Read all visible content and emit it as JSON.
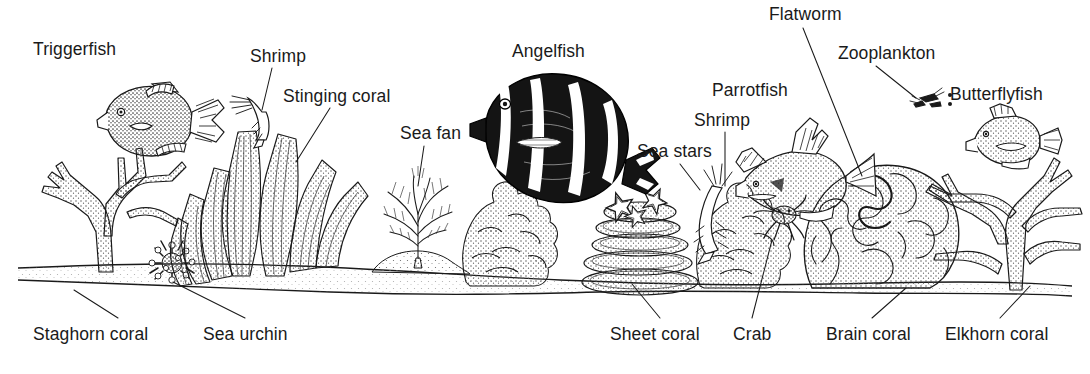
{
  "diagram": {
    "type": "labeled-illustration",
    "style": "black-and-white line drawing with stipple shading",
    "colors": {
      "background": "#ffffff",
      "ink": "#1a1a1a",
      "stipple": "#555555",
      "angelfish_body": "#111111"
    },
    "labels": [
      {
        "id": "triggerfish",
        "text": "Triggerfish",
        "x": 33,
        "y": 40,
        "align": "left",
        "leader": false
      },
      {
        "id": "shrimp-left",
        "text": "Shrimp",
        "x": 250,
        "y": 47,
        "align": "left",
        "leader": true
      },
      {
        "id": "stinging-coral",
        "text": "Stinging coral",
        "x": 283,
        "y": 87,
        "align": "left",
        "leader": true
      },
      {
        "id": "sea-fan",
        "text": "Sea fan",
        "x": 400,
        "y": 124,
        "align": "left",
        "leader": true
      },
      {
        "id": "angelfish",
        "text": "Angelfish",
        "x": 512,
        "y": 42,
        "align": "left",
        "leader": false
      },
      {
        "id": "sea-stars",
        "text": "Sea stars",
        "x": 637,
        "y": 142,
        "align": "left",
        "leader": true
      },
      {
        "id": "shrimp-right",
        "text": "Shrimp",
        "x": 694,
        "y": 111,
        "align": "left",
        "leader": true
      },
      {
        "id": "parrotfish",
        "text": "Parrotfish",
        "x": 712,
        "y": 81,
        "align": "left",
        "leader": false
      },
      {
        "id": "flatworm",
        "text": "Flatworm",
        "x": 769,
        "y": 5,
        "align": "left",
        "leader": true
      },
      {
        "id": "zooplankton",
        "text": "Zooplankton",
        "x": 838,
        "y": 44,
        "align": "left",
        "leader": true
      },
      {
        "id": "butterflyfish",
        "text": "Butterflyfish",
        "x": 950,
        "y": 85,
        "align": "left",
        "leader": false
      },
      {
        "id": "staghorn-coral",
        "text": "Staghorn coral",
        "x": 33,
        "y": 325,
        "align": "left",
        "leader": true
      },
      {
        "id": "sea-urchin",
        "text": "Sea urchin",
        "x": 203,
        "y": 325,
        "align": "left",
        "leader": true
      },
      {
        "id": "sheet-coral",
        "text": "Sheet coral",
        "x": 610,
        "y": 325,
        "align": "left",
        "leader": true
      },
      {
        "id": "crab",
        "text": "Crab",
        "x": 733,
        "y": 325,
        "align": "left",
        "leader": true
      },
      {
        "id": "brain-coral",
        "text": "Brain coral",
        "x": 826,
        "y": 325,
        "align": "left",
        "leader": true
      },
      {
        "id": "elkhorn-coral",
        "text": "Elkhorn coral",
        "x": 945,
        "y": 325,
        "align": "left",
        "leader": true
      }
    ],
    "organisms": [
      "Triggerfish",
      "Shrimp",
      "Stinging coral",
      "Sea fan",
      "Angelfish",
      "Sea stars",
      "Parrotfish",
      "Flatworm",
      "Zooplankton",
      "Butterflyfish",
      "Staghorn coral",
      "Sea urchin",
      "Sheet coral",
      "Crab",
      "Brain coral",
      "Elkhorn coral"
    ]
  }
}
